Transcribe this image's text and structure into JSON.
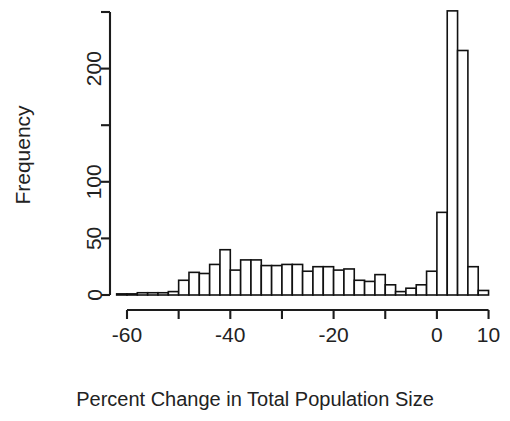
{
  "chart_data": {
    "type": "bar",
    "title": "",
    "subtitle": "",
    "xlabel": "Percent Change in Total Population Size",
    "ylabel": "Frequency",
    "xlim": [
      -62,
      12
    ],
    "ylim": [
      0,
      250
    ],
    "grid": false,
    "legend": null,
    "bin_width": 2,
    "x_ticks": [
      -60,
      -50,
      -40,
      -30,
      -20,
      -10,
      0,
      10
    ],
    "x_tick_labels": [
      "-60",
      "",
      "-40",
      "",
      "-20",
      "",
      "0",
      "10"
    ],
    "y_ticks": [
      0,
      50,
      100,
      150,
      200,
      250
    ],
    "y_tick_labels": [
      "0",
      "50",
      "100",
      "150",
      "200",
      "250"
    ],
    "y_tick_labels_visible": [
      "0",
      "50",
      "100",
      "",
      "200",
      ""
    ],
    "bin_starts": [
      -62,
      -60,
      -58,
      -56,
      -54,
      -52,
      -50,
      -48,
      -46,
      -44,
      -42,
      -40,
      -38,
      -36,
      -34,
      -32,
      -30,
      -28,
      -26,
      -24,
      -22,
      -20,
      -18,
      -16,
      -14,
      -12,
      -10,
      -8,
      -6,
      -4,
      -2,
      0,
      2,
      4,
      6,
      8
    ],
    "bin_centers": [
      -61,
      -59,
      -57,
      -55,
      -53,
      -51,
      -49,
      -47,
      -45,
      -43,
      -41,
      -39,
      -37,
      -35,
      -33,
      -31,
      -29,
      -27,
      -25,
      -23,
      -21,
      -19,
      -17,
      -15,
      -13,
      -11,
      -9,
      -7,
      -5,
      -3,
      -1,
      1,
      3,
      5,
      7,
      9
    ],
    "values": [
      1,
      1,
      2,
      2,
      2,
      3,
      13,
      20,
      19,
      27,
      40,
      22,
      31,
      31,
      26,
      26,
      27,
      27,
      21,
      25,
      25,
      22,
      23,
      13,
      12,
      18,
      9,
      3,
      6,
      9,
      21,
      73,
      251,
      216,
      25,
      4
    ],
    "annotations": []
  },
  "axis": {
    "ylabel_text": "Frequency",
    "xlabel_text": "Percent Change in Total Population Size"
  },
  "ticks": {
    "y": [
      {
        "label": "250",
        "value": 250,
        "visible": false
      },
      {
        "label": "200",
        "value": 200,
        "visible": true
      },
      {
        "label": "150",
        "value": 150,
        "visible": false
      },
      {
        "label": "100",
        "value": 100,
        "visible": true
      },
      {
        "label": "50",
        "value": 50,
        "visible": true
      },
      {
        "label": "0",
        "value": 0,
        "visible": true
      }
    ],
    "x": [
      {
        "label": "-60",
        "value": -60,
        "visible": true
      },
      {
        "label": "-50",
        "value": -50,
        "visible": false
      },
      {
        "label": "-40",
        "value": -40,
        "visible": true
      },
      {
        "label": "-30",
        "value": -30,
        "visible": false
      },
      {
        "label": "-20",
        "value": -20,
        "visible": true
      },
      {
        "label": "-10",
        "value": -10,
        "visible": false
      },
      {
        "label": "0",
        "value": 0,
        "visible": true
      },
      {
        "label": "10",
        "value": 10,
        "visible": true
      }
    ]
  },
  "style": {
    "bar_fill": "#ffffff",
    "bar_stroke": "#111111",
    "axis_color": "#1c1c1c",
    "text_color": "#222222",
    "background": "#ffffff"
  }
}
